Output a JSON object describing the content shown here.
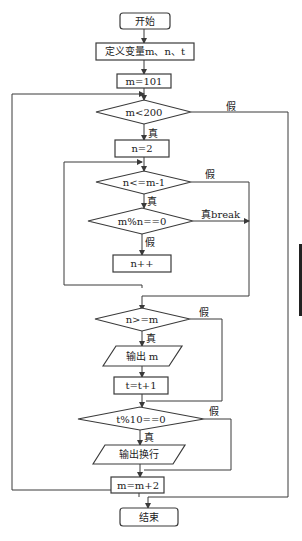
{
  "diagram": {
    "type": "flowchart",
    "nodes": {
      "start": "开始",
      "define": "定义变量m、n、t",
      "init_m": "m=101",
      "cond_m": "m<200",
      "init_n": "n=2",
      "cond_n": "n<=m-1",
      "cond_mod": "m%n==0",
      "inc_n": "n++",
      "cond_prime": "n>=m",
      "output_m": "输出 m",
      "inc_t": "t=t+1",
      "cond_t": "t%10==0",
      "output_newline": "输出换行",
      "inc_m": "m=m+2",
      "end": "结束"
    },
    "edge_labels": {
      "true": "真",
      "false": "假",
      "true_break": "真break"
    },
    "colors": {
      "line": "#3a3a3a",
      "background": "#ffffff"
    }
  }
}
